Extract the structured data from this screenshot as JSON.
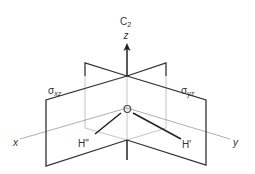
{
  "diagram": {
    "type": "symmetry-elements",
    "molecule": "H2O",
    "labels": {
      "rotation_axis": "C",
      "rotation_axis_sub": "2",
      "z_axis": "z",
      "x_axis": "x",
      "y_axis": "y",
      "oxygen": "O",
      "hydrogen_left": "H\"",
      "hydrogen_right": "H'",
      "plane_xz_sigma": "σ",
      "plane_xz_sub": "xz",
      "plane_yz_sigma": "σ",
      "plane_yz_sub": "yz"
    },
    "colors": {
      "plane_edge": "#333333",
      "hidden_line": "#b0b0b0",
      "axis_line": "#9a9a9a",
      "bond": "#222222",
      "text": "#333333",
      "background": "#ffffff"
    }
  }
}
